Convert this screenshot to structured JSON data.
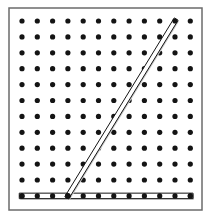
{
  "figure": {
    "title": "Geoboard with rubber bands forming an angle",
    "type": "geoboard-diagram",
    "caption": ""
  },
  "board": {
    "name": "geoboard",
    "frame": {
      "x": 9,
      "y": 8,
      "width": 193,
      "height": 202,
      "border_color": "#6b6b6b",
      "border_width": 1.5,
      "fill_color": "#ffffff"
    },
    "grid": {
      "columns": 12,
      "rows": 12,
      "origin_x": 22,
      "origin_y": 21,
      "spacing_x": 15.3,
      "spacing_y": 15.9,
      "peg_radius": 2.6,
      "peg_color": "#141414"
    }
  },
  "bands": [
    {
      "id": "horizontal-band",
      "label": "Horizontal rubber band",
      "kind": "segment",
      "from": {
        "col": 0,
        "row": 11
      },
      "to": {
        "col": 11,
        "row": 11
      },
      "stroke_color": "#141414",
      "stroke_width": 1,
      "band_thickness": 5.5,
      "shadow_color": "#c9c9c9"
    },
    {
      "id": "slanted-band",
      "label": "Slanted rubber band",
      "kind": "segment",
      "from": {
        "col": 3,
        "row": 11
      },
      "to": {
        "col": 10,
        "row": 0
      },
      "stroke_color": "#141414",
      "stroke_width": 1,
      "band_thickness": 4.5,
      "shadow_color": "#c9c9c9"
    }
  ],
  "vertex": {
    "label": "Angle vertex peg",
    "col": 3,
    "row": 11
  },
  "colors": {
    "background": "#ffffff",
    "ink": "#141414",
    "frame": "#6b6b6b",
    "shadow": "#c9c9c9"
  }
}
